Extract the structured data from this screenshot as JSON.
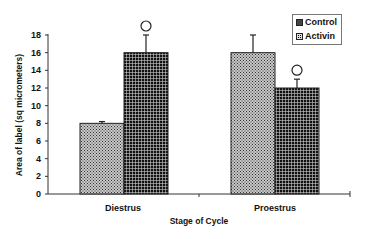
{
  "chart_data": {
    "type": "bar",
    "title": "",
    "xlabel": "Stage of Cycle",
    "ylabel": "Area of label (sq micrometers)",
    "categories": [
      "Diestrus",
      "Proestrus"
    ],
    "series": [
      {
        "name": "Control",
        "values": [
          8,
          16
        ],
        "error": [
          0.2,
          2
        ],
        "significant": [
          false,
          false
        ]
      },
      {
        "name": "Activin",
        "values": [
          16,
          12
        ],
        "error": [
          2,
          1
        ],
        "significant": [
          true,
          true
        ]
      }
    ],
    "ylim": [
      0,
      18
    ],
    "yticks": [
      "0",
      "2",
      "4",
      "6",
      "8",
      "10",
      "12",
      "14",
      "16",
      "18"
    ],
    "grid": false,
    "legend_position": "top-right",
    "significance_marker": "○"
  },
  "legend": {
    "items": [
      {
        "label": "Control"
      },
      {
        "label": "Activin"
      }
    ]
  },
  "axes": {
    "x_title": "Stage of Cycle",
    "y_title": "Area of label (sq micrometers)"
  }
}
